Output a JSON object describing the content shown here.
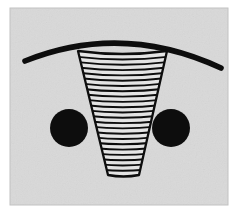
{
  "figure": {
    "title": "Abstract line drawing: striped cone flanked by two filled circles beneath an arc",
    "canvas": {
      "width": 238,
      "height": 216,
      "background_color": "#ffffff"
    },
    "plate": {
      "name": "paper-plate",
      "x": 10,
      "y": 8,
      "width": 218,
      "height": 197,
      "fill_color": "#d8d8d8",
      "border_color": "#c4c4c4",
      "texture": "mottled paper grain"
    },
    "ink_color": "#0d0d0d",
    "shapes": [
      {
        "name": "arc",
        "type": "arc",
        "description": "thick downward-opening arc spanning the upper portion",
        "start": {
          "x": 25,
          "y": 61
        },
        "control": {
          "x": 122,
          "y": 22
        },
        "end": {
          "x": 221,
          "y": 68
        },
        "stroke_width": 5.5
      },
      {
        "name": "cone",
        "type": "tapered-polygon",
        "description": "downward tapering striped cone / funnel with curved top and bottom",
        "top_left": {
          "x": 78,
          "y": 51
        },
        "top_right": {
          "x": 167,
          "y": 51
        },
        "bottom_left": {
          "x": 108,
          "y": 175
        },
        "bottom_right": {
          "x": 139,
          "y": 175
        },
        "top_curve_sag": 6,
        "bottom_curve_sag": 3,
        "stroke_width": 2.2,
        "fill_color": "#e6e6e6",
        "stripe_count": 23,
        "stripe_stroke_width": 1.9
      },
      {
        "name": "left-circle",
        "type": "circle",
        "cx": 69,
        "cy": 128,
        "r": 19,
        "fill_color": "#0d0d0d"
      },
      {
        "name": "right-circle",
        "type": "circle",
        "cx": 171,
        "cy": 128,
        "r": 19,
        "fill_color": "#0d0d0d"
      }
    ]
  }
}
